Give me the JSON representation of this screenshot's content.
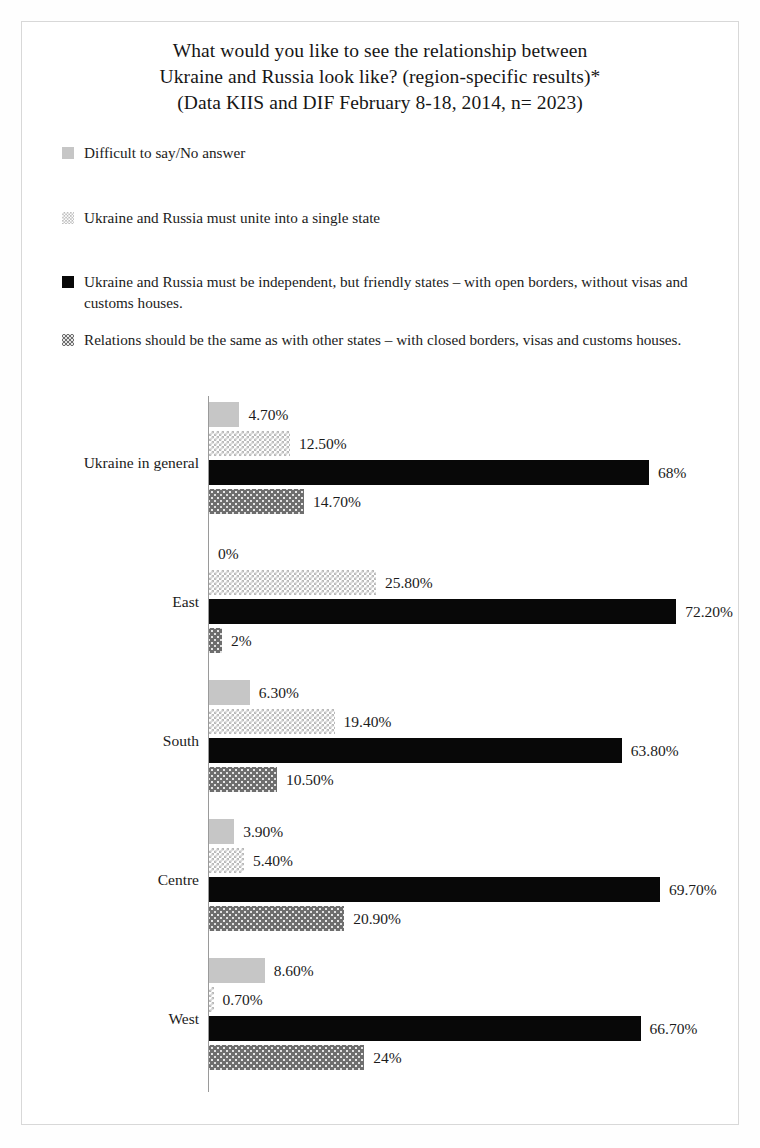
{
  "title": {
    "line1": "What would you like to see the relationship between",
    "line2": "Ukraine and Russia look like? (region-specific results)*",
    "line3": "(Data KIIS and DIF February 8-18, 2014, n= 2023)"
  },
  "legend": [
    {
      "swatch": "light-gray-solid-swatch",
      "label": "Difficult to say/No answer",
      "color": "#c6c6c6"
    },
    {
      "swatch": "light-checker-pattern-swatch",
      "label": "Ukraine and Russia must unite into a single state",
      "color": "#b9b9b9"
    },
    {
      "swatch": "black-solid-swatch",
      "label": "Ukraine and Russia   must be independent, but friendly  states – with open borders, without visas and customs houses.",
      "color": "#080808"
    },
    {
      "swatch": "dark-gray-dotted-swatch",
      "label": "Relations  should be  the same as with other  states – with  closed borders, visas and customs houses.",
      "color": "#6e6e6e"
    }
  ],
  "chart_data": {
    "type": "bar",
    "orientation": "horizontal",
    "title": "What would you like to see the relationship between Ukraine and Russia look like? (region-specific results)* (Data KIIS and DIF February 8-18, 2014, n= 2023)",
    "xlabel": "",
    "ylabel": "",
    "xlim": [
      0,
      80
    ],
    "grid": false,
    "legend_position": "top",
    "categories": [
      "Ukraine in general",
      "East",
      "South",
      "Centre",
      "West"
    ],
    "series": [
      {
        "name": "Difficult to say/No answer",
        "values": [
          4.7,
          0,
          6.3,
          3.9,
          8.6
        ],
        "labels": [
          "4.70%",
          "0%",
          "6.30%",
          "3.90%",
          "8.60%"
        ],
        "color": "#c6c6c6"
      },
      {
        "name": "Ukraine and Russia must unite into a single state",
        "values": [
          12.5,
          25.8,
          19.4,
          5.4,
          0.7
        ],
        "labels": [
          "12.50%",
          "25.80%",
          "19.40%",
          "5.40%",
          "0.70%"
        ],
        "color": "#b9b9b9"
      },
      {
        "name": "Ukraine and Russia must be independent, but friendly states – with open borders, without visas and customs houses.",
        "values": [
          68,
          72.2,
          63.8,
          69.7,
          66.7
        ],
        "labels": [
          "68%",
          "72.20%",
          "63.80%",
          "69.70%",
          "66.70%"
        ],
        "color": "#080808"
      },
      {
        "name": "Relations should be the same as with other states – with closed borders, visas and customs houses.",
        "values": [
          14.7,
          2,
          10.5,
          20.9,
          24
        ],
        "labels": [
          "14.70%",
          "2%",
          "10.50%",
          "20.90%",
          "24%"
        ],
        "color": "#6e6e6e"
      }
    ]
  }
}
